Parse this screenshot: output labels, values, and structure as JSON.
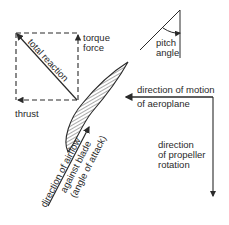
{
  "diagram": {
    "labels": {
      "total_reaction": "total reaction",
      "torque_force_1": "torque",
      "torque_force_2": "force",
      "thrust": "thrust",
      "pitch_angle_1": "pitch",
      "pitch_angle_2": "angle",
      "motion_1": "direction of motion",
      "motion_2": "of aeroplane",
      "rotation_1": "direction",
      "rotation_2": "of propeller",
      "rotation_3": "rotation",
      "airflow_1": "direction of airflow",
      "airflow_2": "against blade",
      "airflow_3": "(angle of attack)"
    },
    "colors": {
      "ink": "#2a2a2a",
      "background": "#ffffff"
    }
  }
}
